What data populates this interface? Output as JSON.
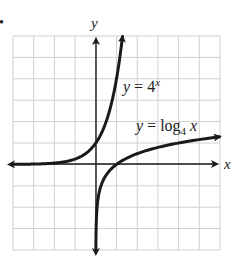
{
  "bullet": "•",
  "chart_data": {
    "type": "line",
    "title": "",
    "xlabel": "x",
    "ylabel": "y",
    "xlim": [
      -4,
      6
    ],
    "ylim": [
      -4,
      6
    ],
    "grid": true,
    "grid_step": 1,
    "tick_labels": false,
    "legend": "inline annotations",
    "series": [
      {
        "name": "y = 4^x",
        "label_parts": {
          "lhs": "y",
          "eq": " = ",
          "base": "4",
          "exp": "x"
        },
        "function": "4^x",
        "x": [
          -4,
          -3,
          -2,
          -1,
          0,
          0.5,
          1,
          1.29
        ],
        "y": [
          0.0039,
          0.0156,
          0.0625,
          0.25,
          1,
          2,
          4,
          6
        ],
        "arrows": [
          "left",
          "up"
        ]
      },
      {
        "name": "y = log4 x",
        "label_parts": {
          "lhs": "y",
          "eq": " = ",
          "func": "log",
          "sub": "4",
          "arg": " x"
        },
        "function": "log_4(x)",
        "x": [
          0.0039,
          0.0156,
          0.0625,
          0.25,
          1,
          2,
          4,
          6
        ],
        "y": [
          -4,
          -3,
          -2,
          -1,
          0,
          0.5,
          1,
          1.29
        ],
        "arrows": [
          "down",
          "right"
        ]
      }
    ],
    "axis_lines": {
      "x_axis_at_y": 0,
      "y_axis_at_x": 0,
      "arrows": true
    },
    "colors": {
      "grid": "#cfcfcf",
      "ink": "#1a1a1a",
      "background": "#ffffff"
    }
  }
}
